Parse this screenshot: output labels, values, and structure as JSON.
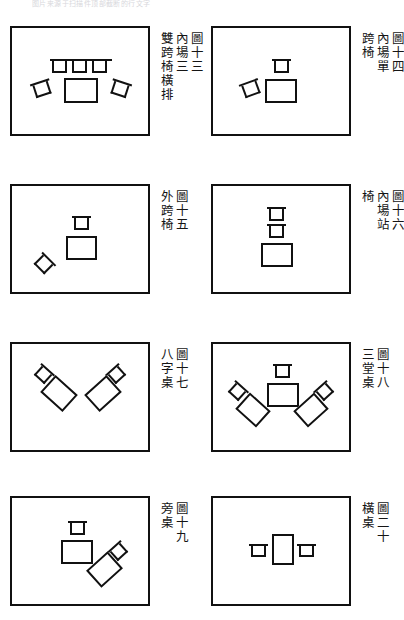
{
  "page": {
    "header_faint_text": "图片来源于扫描件顶部截断的行文字",
    "background_color": "#ffffff",
    "ink_color": "#111111",
    "figure_count": 8,
    "columns": 2,
    "rows": 4
  },
  "figures": [
    {
      "id": "fig-13",
      "position": "row1-left",
      "caption_columns": [
        "圖十三",
        "內場三",
        "雙跨椅橫排"
      ],
      "figure_number": "圖十三",
      "items": [
        {
          "kind": "bench",
          "name": "back-bench-rail",
          "x": 38,
          "y": 31,
          "w": 62,
          "h": 0,
          "rot": 0
        },
        {
          "kind": "chair",
          "name": "chair-back-left",
          "x": 40,
          "y": 33,
          "w": 15,
          "h": 12,
          "rot": 0
        },
        {
          "kind": "chair",
          "name": "chair-back-center",
          "x": 60,
          "y": 33,
          "w": 15,
          "h": 12,
          "rot": 0
        },
        {
          "kind": "chair",
          "name": "chair-back-right",
          "x": 80,
          "y": 33,
          "w": 15,
          "h": 12,
          "rot": 0
        },
        {
          "kind": "table",
          "name": "center-table",
          "x": 52,
          "y": 50,
          "w": 34,
          "h": 25,
          "rot": 0
        },
        {
          "kind": "chair",
          "name": "chair-side-left",
          "x": 22,
          "y": 55,
          "w": 16,
          "h": 13,
          "rot": -18
        },
        {
          "kind": "chair",
          "name": "chair-side-right",
          "x": 100,
          "y": 55,
          "w": 16,
          "h": 13,
          "rot": 18
        }
      ]
    },
    {
      "id": "fig-14",
      "position": "row1-right",
      "caption_columns": [
        "圖十四",
        "內場單",
        "跨椅"
      ],
      "figure_number": "圖十四",
      "items": [
        {
          "kind": "chair",
          "name": "chair-back-center",
          "x": 61,
          "y": 33,
          "w": 15,
          "h": 12,
          "rot": 0
        },
        {
          "kind": "table",
          "name": "center-table",
          "x": 52,
          "y": 51,
          "w": 32,
          "h": 24,
          "rot": 0
        },
        {
          "kind": "chair",
          "name": "chair-side-left",
          "x": 30,
          "y": 55,
          "w": 16,
          "h": 13,
          "rot": -20
        }
      ]
    },
    {
      "id": "fig-15",
      "position": "row2-left",
      "caption_columns": [
        "圖十五",
        "外跨椅"
      ],
      "figure_number": "圖十五",
      "items": [
        {
          "kind": "chair",
          "name": "chair-back-center",
          "x": 62,
          "y": 32,
          "w": 15,
          "h": 12,
          "rot": 0
        },
        {
          "kind": "table",
          "name": "center-table",
          "x": 54,
          "y": 50,
          "w": 31,
          "h": 24,
          "rot": 0
        },
        {
          "kind": "chair",
          "name": "chair-lower-left-45",
          "x": 24,
          "y": 72,
          "w": 15,
          "h": 13,
          "rot": 45
        }
      ]
    },
    {
      "id": "fig-16",
      "position": "row2-right",
      "caption_columns": [
        "圖十六",
        "內場站",
        "椅"
      ],
      "figure_number": "圖十六",
      "items": [
        {
          "kind": "chair",
          "name": "chair-upper",
          "x": 56,
          "y": 23,
          "w": 15,
          "h": 12,
          "rot": 0
        },
        {
          "kind": "chair",
          "name": "chair-lower",
          "x": 56,
          "y": 40,
          "w": 15,
          "h": 12,
          "rot": 0
        },
        {
          "kind": "table",
          "name": "center-table",
          "x": 48,
          "y": 57,
          "w": 32,
          "h": 24,
          "rot": 0
        }
      ]
    },
    {
      "id": "fig-17",
      "position": "row3-left",
      "caption_columns": [
        "圖十七",
        "八字桌"
      ],
      "figure_number": "圖十七",
      "items": [
        {
          "kind": "chair",
          "name": "chair-left-group",
          "x": 24,
          "y": 25,
          "w": 14,
          "h": 12,
          "rot": 42
        },
        {
          "kind": "table",
          "name": "table-left-group",
          "x": 32,
          "y": 38,
          "w": 30,
          "h": 23,
          "rot": 42
        },
        {
          "kind": "chair",
          "name": "chair-right-group",
          "x": 98,
          "y": 25,
          "w": 14,
          "h": 12,
          "rot": -42
        },
        {
          "kind": "table",
          "name": "table-right-group",
          "x": 76,
          "y": 38,
          "w": 30,
          "h": 23,
          "rot": -42
        }
      ]
    },
    {
      "id": "fig-18",
      "position": "row3-right",
      "caption_columns": [
        "圖十八",
        "三堂桌"
      ],
      "figure_number": "圖十八",
      "items": [
        {
          "kind": "chair",
          "name": "chair-center",
          "x": 62,
          "y": 22,
          "w": 15,
          "h": 12,
          "rot": 0
        },
        {
          "kind": "table",
          "name": "table-center",
          "x": 54,
          "y": 39,
          "w": 32,
          "h": 24,
          "rot": 0
        },
        {
          "kind": "chair",
          "name": "chair-left-group",
          "x": 17,
          "y": 42,
          "w": 14,
          "h": 12,
          "rot": 42
        },
        {
          "kind": "table",
          "name": "table-left-group",
          "x": 26,
          "y": 55,
          "w": 28,
          "h": 22,
          "rot": 42
        },
        {
          "kind": "chair",
          "name": "chair-right-group",
          "x": 105,
          "y": 42,
          "w": 14,
          "h": 12,
          "rot": -42
        },
        {
          "kind": "table",
          "name": "table-right-group",
          "x": 84,
          "y": 55,
          "w": 28,
          "h": 22,
          "rot": -42
        }
      ]
    },
    {
      "id": "fig-19",
      "position": "row4-left",
      "caption_columns": [
        "圖十九",
        "旁桌"
      ],
      "figure_number": "圖十九",
      "items": [
        {
          "kind": "chair",
          "name": "chair-main",
          "x": 58,
          "y": 25,
          "w": 15,
          "h": 12,
          "rot": 0
        },
        {
          "kind": "table",
          "name": "table-main",
          "x": 49,
          "y": 42,
          "w": 32,
          "h": 24,
          "rot": 0
        },
        {
          "kind": "chair",
          "name": "chair-side-group",
          "x": 100,
          "y": 48,
          "w": 14,
          "h": 12,
          "rot": -42
        },
        {
          "kind": "table",
          "name": "table-side-group",
          "x": 78,
          "y": 60,
          "w": 29,
          "h": 23,
          "rot": -42
        }
      ]
    },
    {
      "id": "fig-20",
      "position": "row4-right",
      "caption_columns": [
        "圖二十",
        "橫桌"
      ],
      "figure_number": "圖二十",
      "items": [
        {
          "kind": "table",
          "name": "table-vertical",
          "x": 59,
          "y": 36,
          "w": 22,
          "h": 31,
          "rot": 0
        },
        {
          "kind": "chair",
          "name": "chair-left-facing",
          "x": 38,
          "y": 48,
          "w": 15,
          "h": 11,
          "rot": 0
        },
        {
          "kind": "chair",
          "name": "chair-right-facing",
          "x": 86,
          "y": 48,
          "w": 15,
          "h": 11,
          "rot": 0
        }
      ]
    }
  ]
}
